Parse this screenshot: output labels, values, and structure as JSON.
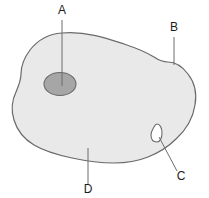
{
  "figure": {
    "type": "labelled-cell-diagram",
    "background_color": "#ffffff",
    "cell": {
      "name": "cell-body",
      "fill_color": "#e9e9e9",
      "stroke_color": "#6a6a6a"
    },
    "nucleus": {
      "name": "nucleus",
      "fill_color": "#a6a6a6",
      "stroke_color": "#6a6a6a"
    },
    "vacuole": {
      "name": "vacuole",
      "fill_color": "#ffffff",
      "stroke_color": "#6a6a6a"
    },
    "labels": [
      {
        "id": "A",
        "text": "A",
        "name": "label-a",
        "target": "nucleus",
        "x": 62,
        "y": 14,
        "leader": {
          "x1": 62,
          "y1": 20,
          "x2": 62,
          "y2": 86
        }
      },
      {
        "id": "B",
        "text": "B",
        "name": "label-b",
        "target": "cell-membrane",
        "x": 174,
        "y": 31,
        "leader": {
          "x1": 174,
          "y1": 37,
          "x2": 174,
          "y2": 65
        }
      },
      {
        "id": "C",
        "text": "C",
        "name": "label-c",
        "target": "vacuole",
        "x": 181,
        "y": 180,
        "leader": {
          "x1": 177,
          "y1": 171,
          "x2": 159,
          "y2": 137
        }
      },
      {
        "id": "D",
        "text": "D",
        "name": "label-d",
        "target": "cytoplasm",
        "x": 88,
        "y": 193,
        "leader": {
          "x1": 88,
          "y1": 184,
          "x2": 88,
          "y2": 148
        }
      }
    ]
  }
}
